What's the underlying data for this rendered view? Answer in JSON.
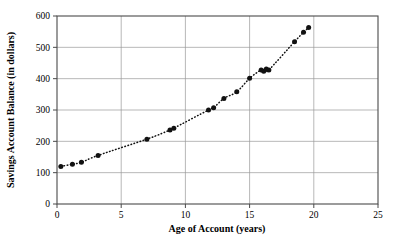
{
  "chart_data": {
    "type": "scatter",
    "title": "",
    "xlabel": "Age of Account (years)",
    "ylabel": "Savings Account Balance (in dollars)",
    "xlim": [
      0,
      25
    ],
    "ylim": [
      0,
      600
    ],
    "xticks": [
      0,
      5,
      10,
      15,
      20,
      25
    ],
    "yticks": [
      0,
      100,
      200,
      300,
      400,
      500,
      600
    ],
    "xtick_labels": [
      "0",
      "5",
      "10",
      "15",
      "20",
      "25"
    ],
    "ytick_labels": [
      "0",
      "100",
      "200",
      "300",
      "400",
      "500",
      "600"
    ],
    "grid": "horizontal-and-vertical",
    "legend": "none",
    "marker": "filled-circle",
    "trendline": {
      "style": "dotted",
      "shape": "exponential-growth",
      "label": ""
    },
    "x": [
      0.3,
      1.2,
      1.9,
      3.2,
      7.0,
      8.8,
      9.1,
      11.8,
      12.2,
      13.0,
      14.0,
      15.0,
      15.9,
      16.1,
      16.3,
      16.5,
      18.5,
      19.2,
      19.6
    ],
    "y": [
      120,
      127,
      133,
      155,
      207,
      236,
      242,
      300,
      307,
      337,
      358,
      401,
      428,
      424,
      431,
      428,
      518,
      548,
      563
    ],
    "points": [
      {
        "x": 0.3,
        "y": 120
      },
      {
        "x": 1.2,
        "y": 127
      },
      {
        "x": 1.9,
        "y": 133
      },
      {
        "x": 3.2,
        "y": 155
      },
      {
        "x": 7.0,
        "y": 207
      },
      {
        "x": 8.8,
        "y": 236
      },
      {
        "x": 9.1,
        "y": 242
      },
      {
        "x": 11.8,
        "y": 300
      },
      {
        "x": 12.2,
        "y": 307
      },
      {
        "x": 13.0,
        "y": 337
      },
      {
        "x": 14.0,
        "y": 358
      },
      {
        "x": 15.0,
        "y": 401
      },
      {
        "x": 15.9,
        "y": 428
      },
      {
        "x": 16.1,
        "y": 424
      },
      {
        "x": 16.3,
        "y": 431
      },
      {
        "x": 16.5,
        "y": 428
      },
      {
        "x": 18.5,
        "y": 518
      },
      {
        "x": 19.2,
        "y": 548
      },
      {
        "x": 19.6,
        "y": 563
      }
    ],
    "colors": {
      "marker": "#111111",
      "trendline": "#111111",
      "grid": "#9a9a9a",
      "frame": "#4a4a4a",
      "background": "#ffffff"
    }
  }
}
